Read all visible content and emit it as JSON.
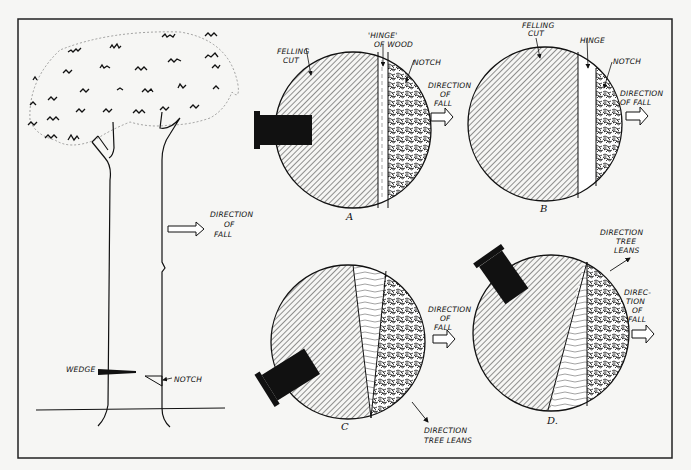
{
  "diagram": {
    "colors": {
      "ink": "#111111",
      "paper": "#f6f6f4",
      "frame": "#222222"
    },
    "tree": {
      "labels": {
        "direction_line1": "DIRECTION",
        "direction_line2": "OF",
        "direction_line3": "FALL",
        "wedge": "WEDGE",
        "notch": "NOTCH"
      }
    },
    "panels": [
      {
        "id": "A",
        "caption": "A",
        "labels": {
          "felling_cut_1": "FELLING",
          "felling_cut_2": "CUT",
          "hinge_1": "'HINGE'",
          "hinge_2": "OF WOOD",
          "notch": "NOTCH",
          "direction_1": "DIRECTION",
          "direction_2": "OF",
          "direction_3": "FALL"
        }
      },
      {
        "id": "B",
        "caption": "B",
        "labels": {
          "felling_cut_1": "FELLING",
          "felling_cut_2": "CUT",
          "hinge": "HINGE",
          "notch": "NOTCH",
          "direction_1": "DIRECTION",
          "direction_2": "OF FALL"
        }
      },
      {
        "id": "C",
        "caption": "C",
        "labels": {
          "direction_1": "DIRECTION",
          "direction_2": "OF",
          "direction_3": "FALL",
          "lean_1": "DIRECTION",
          "lean_2": "TREE LEANS"
        }
      },
      {
        "id": "D",
        "caption": "D.",
        "labels": {
          "lean_1": "DIRECTION",
          "lean_2": "TREE",
          "lean_3": "LEANS",
          "direction_1": "DIREC-",
          "direction_2": "TION",
          "direction_3": "OF",
          "direction_4": "FALL"
        }
      }
    ]
  }
}
